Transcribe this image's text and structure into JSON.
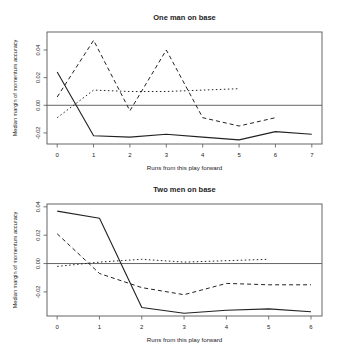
{
  "chart_data": [
    {
      "type": "line",
      "title": "One man on base",
      "xlabel": "Runs from this play forward",
      "ylabel": "Median margin of momentum accuracy",
      "x_ticks": [
        0,
        1,
        2,
        3,
        4,
        5,
        6,
        7
      ],
      "y_ticks": [
        -0.02,
        0.0,
        0.02,
        0.04
      ],
      "y_tick_labels": [
        "-0.02",
        "0.00",
        "0.02",
        "0.04"
      ],
      "xlim": [
        -0.28,
        7.28
      ],
      "ylim": [
        -0.028,
        0.053
      ],
      "reference_line": 0.0,
      "grid": false,
      "legend": null,
      "series": [
        {
          "name": "solid",
          "style": "solid",
          "x": [
            0,
            1,
            2,
            3,
            4,
            5,
            6,
            7
          ],
          "values": [
            0.024,
            -0.022,
            -0.023,
            -0.021,
            -0.023,
            -0.025,
            -0.019,
            -0.021
          ]
        },
        {
          "name": "dashed",
          "style": "dashed",
          "x": [
            0,
            1,
            2,
            3,
            4,
            5,
            6
          ],
          "values": [
            0.006,
            0.047,
            -0.004,
            0.04,
            -0.009,
            -0.015,
            -0.009
          ]
        },
        {
          "name": "dotted",
          "style": "dotted",
          "x": [
            0,
            1,
            2,
            3,
            4,
            5
          ],
          "values": [
            -0.009,
            0.011,
            0.01,
            0.01,
            0.011,
            0.012
          ]
        }
      ]
    },
    {
      "type": "line",
      "title": "Two men on base",
      "xlabel": "Runs from this play forward",
      "ylabel": "Median margin of momentum accuracy",
      "x_ticks": [
        0,
        1,
        2,
        3,
        4,
        5,
        6
      ],
      "y_ticks": [
        -0.02,
        0.0,
        0.02,
        0.04
      ],
      "y_tick_labels": [
        "-0.02",
        "0.00",
        "0.02",
        "0.04"
      ],
      "xlim": [
        -0.24,
        6.26
      ],
      "ylim": [
        -0.037,
        0.042
      ],
      "reference_line": 0.0,
      "grid": false,
      "legend": null,
      "series": [
        {
          "name": "solid",
          "style": "solid",
          "x": [
            0,
            1,
            2,
            3,
            4,
            5,
            6
          ],
          "values": [
            0.037,
            0.032,
            -0.031,
            -0.035,
            -0.033,
            -0.032,
            -0.034
          ]
        },
        {
          "name": "dashed",
          "style": "dashed",
          "x": [
            0,
            1,
            2,
            3,
            4,
            5,
            6
          ],
          "values": [
            0.021,
            -0.007,
            -0.017,
            -0.022,
            -0.014,
            -0.015,
            -0.015
          ]
        },
        {
          "name": "dotted",
          "style": "dotted",
          "x": [
            0,
            1,
            2,
            3,
            4,
            5
          ],
          "values": [
            -0.002,
            0.001,
            0.003,
            0.001,
            0.002,
            0.003
          ]
        }
      ]
    }
  ],
  "layout": {
    "panels": [
      {
        "box": {
          "left": 47,
          "top": 32,
          "right": 322,
          "bottom": 144
        },
        "title_y": 20,
        "tick_label_y": 157,
        "xlabel_y": 170
      },
      {
        "box": {
          "left": 47,
          "top": 204,
          "right": 322,
          "bottom": 316
        },
        "title_y": 192,
        "tick_label_y": 329,
        "xlabel_y": 342
      }
    ]
  },
  "colors": {
    "line": "#222222",
    "axis": "#555555",
    "text": "#222222"
  }
}
